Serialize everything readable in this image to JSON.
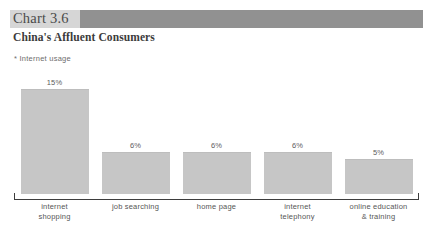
{
  "header": {
    "chart_number": "Chart 3.6",
    "subtitle": "China's Affluent Consumers",
    "note": "* Internet usage",
    "band_color": "#d6d6d6",
    "accent_color": "#919191"
  },
  "chart_data": {
    "type": "bar",
    "title": "China's Affluent Consumers",
    "subtitle": "Chart 3.6",
    "annotation": "* Internet usage",
    "categories": [
      "internet\nshopping",
      "job searching",
      "home page",
      "internet\ntelephony",
      "online education\n& training"
    ],
    "category_lines": [
      [
        "internet",
        "shopping"
      ],
      [
        "job searching",
        ""
      ],
      [
        "home page",
        ""
      ],
      [
        "internet",
        "telephony"
      ],
      [
        "online education",
        "& training"
      ]
    ],
    "values": [
      15,
      6,
      6,
      6,
      5
    ],
    "value_labels": [
      "15%",
      "6%",
      "6%",
      "6%",
      "5%"
    ],
    "xlabel": "",
    "ylabel": "",
    "ylim": [
      0,
      17
    ],
    "grid": false,
    "legend": false,
    "bar_color": "#c6c6c6",
    "axis_color": "#3d3d3d"
  }
}
